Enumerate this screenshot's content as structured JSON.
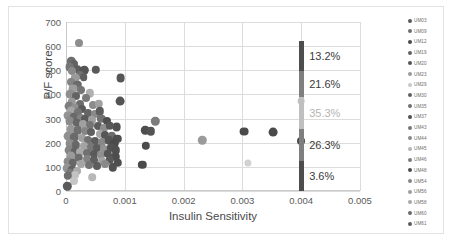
{
  "chart_data": {
    "type": "scatter",
    "title": "",
    "xlabel": "Insulin Sensitivity",
    "ylabel": "P/F score",
    "xlim": [
      0,
      0.005
    ],
    "ylim": [
      0,
      700
    ],
    "xticks": [
      "0",
      "0.001",
      "0.002",
      "0.003",
      "0.004",
      "0.005"
    ],
    "xtick_values": [
      0,
      0.001,
      0.002,
      0.003,
      0.004,
      0.005
    ],
    "yticks": [
      "0",
      "100",
      "200",
      "300",
      "400",
      "500",
      "600",
      "700"
    ],
    "ytick_values": [
      0,
      100,
      200,
      300,
      400,
      500,
      600,
      700
    ],
    "grid": true,
    "legend_position": "right",
    "legend": [
      {
        "label": "UM03",
        "color": "#595959"
      },
      {
        "label": "UM09",
        "color": "#6e6e6e"
      },
      {
        "label": "UM12",
        "color": "#4a4a4a"
      },
      {
        "label": "UM19",
        "color": "#636363"
      },
      {
        "label": "UM20",
        "color": "#555555"
      },
      {
        "label": "UM23",
        "color": "#9a9a9a"
      },
      {
        "label": "UM29",
        "color": "#c8c8c8"
      },
      {
        "label": "UM30",
        "color": "#5f5f5f"
      },
      {
        "label": "UM35",
        "color": "#707070"
      },
      {
        "label": "UM37",
        "color": "#4f4f4f"
      },
      {
        "label": "UM43",
        "color": "#777777"
      },
      {
        "label": "UM44",
        "color": "#8a8a8a"
      },
      {
        "label": "UM45",
        "color": "#b4b4b4"
      },
      {
        "label": "UM46",
        "color": "#7d7d7d"
      },
      {
        "label": "UM48",
        "color": "#4d4d4d"
      },
      {
        "label": "UM54",
        "color": "#868686"
      },
      {
        "label": "UM56",
        "color": "#9d9d9d"
      },
      {
        "label": "UM58",
        "color": "#a8a8a8"
      },
      {
        "label": "UM60",
        "color": "#6a6a6a"
      },
      {
        "label": "UM61",
        "color": "#5c5c5c"
      }
    ],
    "points": [
      {
        "x": 0.00022,
        "y": 612,
        "c": "#8d8d8d",
        "r": 4.0
      },
      {
        "x": 9e-05,
        "y": 537,
        "c": "#6e6e6e",
        "r": 4.2
      },
      {
        "x": 0.00014,
        "y": 528,
        "c": "#616161",
        "r": 4.0
      },
      {
        "x": 6e-05,
        "y": 512,
        "c": "#757575",
        "r": 4.4
      },
      {
        "x": 0.0002,
        "y": 505,
        "c": "#5e5e5e",
        "r": 3.8
      },
      {
        "x": 0.00011,
        "y": 496,
        "c": "#8a8a8a",
        "r": 4.0
      },
      {
        "x": 0.00031,
        "y": 500,
        "c": "#555555",
        "r": 4.2
      },
      {
        "x": 0.00051,
        "y": 503,
        "c": "#5a5a5a",
        "r": 4.2
      },
      {
        "x": 0.00024,
        "y": 479,
        "c": "#707070",
        "r": 4.0
      },
      {
        "x": 0.00016,
        "y": 470,
        "c": "#9a9a9a",
        "r": 4.2
      },
      {
        "x": 0.0003,
        "y": 472,
        "c": "#5f5f5f",
        "r": 3.8
      },
      {
        "x": 0.00093,
        "y": 468,
        "c": "#565656",
        "r": 4.4
      },
      {
        "x": 8e-05,
        "y": 452,
        "c": "#848484",
        "r": 4.0
      },
      {
        "x": 0.00019,
        "y": 440,
        "c": "#6b6b6b",
        "r": 4.2
      },
      {
        "x": 0.00012,
        "y": 424,
        "c": "#9c9c9c",
        "r": 4.4
      },
      {
        "x": 0.00026,
        "y": 418,
        "c": "#757575",
        "r": 4.0
      },
      {
        "x": 0.0004,
        "y": 404,
        "c": "#b0b0b0",
        "r": 4.2
      },
      {
        "x": 7e-05,
        "y": 400,
        "c": "#8f8f8f",
        "r": 4.4
      },
      {
        "x": 0.00017,
        "y": 392,
        "c": "#636363",
        "r": 4.0
      },
      {
        "x": 0.00034,
        "y": 386,
        "c": "#7a7a7a",
        "r": 4.0
      },
      {
        "x": 0.00092,
        "y": 374,
        "c": "#545454",
        "r": 4.4
      },
      {
        "x": 0.0001,
        "y": 368,
        "c": "#999999",
        "r": 4.2
      },
      {
        "x": 0.00023,
        "y": 360,
        "c": "#6d6d6d",
        "r": 4.0
      },
      {
        "x": 0.00046,
        "y": 357,
        "c": "#8c8c8c",
        "r": 4.0
      },
      {
        "x": 0.00056,
        "y": 360,
        "c": "#a2a2a2",
        "r": 4.2
      },
      {
        "x": 5e-05,
        "y": 352,
        "c": "#7e7e7e",
        "r": 4.4
      },
      {
        "x": 0.00015,
        "y": 344,
        "c": "#909090",
        "r": 4.2
      },
      {
        "x": 0.00028,
        "y": 338,
        "c": "#5b5b5b",
        "r": 4.0
      },
      {
        "x": 9e-05,
        "y": 330,
        "c": "#a5a5a5",
        "r": 4.4
      },
      {
        "x": 0.00021,
        "y": 326,
        "c": "#747474",
        "r": 4.0
      },
      {
        "x": 0.00037,
        "y": 322,
        "c": "#656565",
        "r": 4.0
      },
      {
        "x": 0.0005,
        "y": 318,
        "c": "#8a8a8a",
        "r": 4.0
      },
      {
        "x": 0.00058,
        "y": 330,
        "c": "#5d5d5d",
        "r": 4.2
      },
      {
        "x": 4e-05,
        "y": 312,
        "c": "#949494",
        "r": 4.4
      },
      {
        "x": 0.00013,
        "y": 308,
        "c": "#6a6a6a",
        "r": 4.2
      },
      {
        "x": 0.00025,
        "y": 302,
        "c": "#828282",
        "r": 4.0
      },
      {
        "x": 0.00033,
        "y": 298,
        "c": "#5a5a5a",
        "r": 4.0
      },
      {
        "x": 0.00044,
        "y": 294,
        "c": "#9e9e9e",
        "r": 4.0
      },
      {
        "x": 0.0006,
        "y": 300,
        "c": "#717171",
        "r": 4.2
      },
      {
        "x": 0.00069,
        "y": 292,
        "c": "#4f4f4f",
        "r": 4.0
      },
      {
        "x": 0.00086,
        "y": 266,
        "c": "#505050",
        "r": 4.4
      },
      {
        "x": 0.00152,
        "y": 288,
        "c": "#7c7c7c",
        "r": 4.2
      },
      {
        "x": 6e-05,
        "y": 288,
        "c": "#8b8b8b",
        "r": 4.4
      },
      {
        "x": 0.00018,
        "y": 282,
        "c": "#666666",
        "r": 4.2
      },
      {
        "x": 0.00029,
        "y": 278,
        "c": "#a0a0a0",
        "r": 4.0
      },
      {
        "x": 0.00041,
        "y": 272,
        "c": "#757575",
        "r": 4.0
      },
      {
        "x": 0.00054,
        "y": 268,
        "c": "#5c5c5c",
        "r": 4.0
      },
      {
        "x": 0.00064,
        "y": 262,
        "c": "#8e8e8e",
        "r": 4.0
      },
      {
        "x": 0.00075,
        "y": 270,
        "c": "#585858",
        "r": 4.2
      },
      {
        "x": 0.00135,
        "y": 252,
        "c": "#4d4d4d",
        "r": 4.2
      },
      {
        "x": 0.00144,
        "y": 248,
        "c": "#535353",
        "r": 4.2
      },
      {
        "x": 0.00232,
        "y": 210,
        "c": "#9b9b9b",
        "r": 4.2
      },
      {
        "x": 0.00303,
        "y": 246,
        "c": "#4a4a4a",
        "r": 4.4
      },
      {
        "x": 0.00352,
        "y": 244,
        "c": "#4a4a4a",
        "r": 4.4
      },
      {
        "x": 8e-05,
        "y": 258,
        "c": "#979797",
        "r": 4.4
      },
      {
        "x": 0.0002,
        "y": 252,
        "c": "#6f6f6f",
        "r": 4.2
      },
      {
        "x": 0.00032,
        "y": 248,
        "c": "#858585",
        "r": 4.0
      },
      {
        "x": 0.00043,
        "y": 244,
        "c": "#606060",
        "r": 4.0
      },
      {
        "x": 0.00057,
        "y": 238,
        "c": "#a6a6a6",
        "r": 4.0
      },
      {
        "x": 0.00066,
        "y": 232,
        "c": "#565656",
        "r": 4.0
      },
      {
        "x": 0.00078,
        "y": 228,
        "c": "#6c6c6c",
        "r": 4.2
      },
      {
        "x": 0.00087,
        "y": 216,
        "c": "#4e4e4e",
        "r": 4.2
      },
      {
        "x": 0.00136,
        "y": 188,
        "c": "#4c4c4c",
        "r": 4.2
      },
      {
        "x": 3e-05,
        "y": 228,
        "c": "#909090",
        "r": 4.4
      },
      {
        "x": 0.00014,
        "y": 222,
        "c": "#6a6a6a",
        "r": 4.2
      },
      {
        "x": 0.00027,
        "y": 218,
        "c": "#9f9f9f",
        "r": 4.0
      },
      {
        "x": 0.00038,
        "y": 212,
        "c": "#727272",
        "r": 4.0
      },
      {
        "x": 0.00049,
        "y": 208,
        "c": "#5e5e5e",
        "r": 4.0
      },
      {
        "x": 0.00062,
        "y": 204,
        "c": "#888888",
        "r": 4.0
      },
      {
        "x": 0.00073,
        "y": 210,
        "c": "#555555",
        "r": 4.2
      },
      {
        "x": 0.00082,
        "y": 198,
        "c": "#4b4b4b",
        "r": 4.2
      },
      {
        "x": 0.004,
        "y": 206,
        "c": "#4a4a4a",
        "r": 4.0
      },
      {
        "x": 7e-05,
        "y": 196,
        "c": "#8d8d8d",
        "r": 4.4
      },
      {
        "x": 0.00017,
        "y": 190,
        "c": "#686868",
        "r": 4.2
      },
      {
        "x": 0.0003,
        "y": 186,
        "c": "#a3a3a3",
        "r": 4.0
      },
      {
        "x": 0.00042,
        "y": 182,
        "c": "#777777",
        "r": 4.0
      },
      {
        "x": 0.00053,
        "y": 178,
        "c": "#5d5d5d",
        "r": 4.0
      },
      {
        "x": 0.00065,
        "y": 174,
        "c": "#929292",
        "r": 4.0
      },
      {
        "x": 0.00077,
        "y": 180,
        "c": "#525252",
        "r": 4.2
      },
      {
        "x": 0.00085,
        "y": 168,
        "c": "#4f4f4f",
        "r": 4.2
      },
      {
        "x": 5e-05,
        "y": 170,
        "c": "#868686",
        "r": 4.4
      },
      {
        "x": 0.00016,
        "y": 164,
        "c": "#646464",
        "r": 4.2
      },
      {
        "x": 0.00024,
        "y": 160,
        "c": "#a8a8a8",
        "r": 4.0
      },
      {
        "x": 0.00036,
        "y": 156,
        "c": "#707070",
        "r": 4.0
      },
      {
        "x": 0.00047,
        "y": 152,
        "c": "#5a5a5a",
        "r": 4.0
      },
      {
        "x": 0.00059,
        "y": 148,
        "c": "#8f8f8f",
        "r": 4.0
      },
      {
        "x": 0.00071,
        "y": 154,
        "c": "#565656",
        "r": 4.2
      },
      {
        "x": 0.00084,
        "y": 142,
        "c": "#4d4d4d",
        "r": 4.2
      },
      {
        "x": 0.0013,
        "y": 108,
        "c": "#4b4b4b",
        "r": 4.2
      },
      {
        "x": 9e-05,
        "y": 144,
        "c": "#9a9a9a",
        "r": 4.4
      },
      {
        "x": 0.00022,
        "y": 138,
        "c": "#6d6d6d",
        "r": 4.2
      },
      {
        "x": 0.00035,
        "y": 134,
        "c": "#838383",
        "r": 4.0
      },
      {
        "x": 0.00048,
        "y": 128,
        "c": "#5f5f5f",
        "r": 4.0
      },
      {
        "x": 0.00061,
        "y": 124,
        "c": "#a1a1a1",
        "r": 4.0
      },
      {
        "x": 0.00074,
        "y": 130,
        "c": "#595959",
        "r": 4.2
      },
      {
        "x": 0.00088,
        "y": 118,
        "c": "#4e4e4e",
        "r": 4.2
      },
      {
        "x": 4e-05,
        "y": 122,
        "c": "#8c8c8c",
        "r": 4.4
      },
      {
        "x": 0.00012,
        "y": 116,
        "c": "#676767",
        "r": 4.2
      },
      {
        "x": 0.00026,
        "y": 112,
        "c": "#a4a4a4",
        "r": 4.0
      },
      {
        "x": 0.00039,
        "y": 108,
        "c": "#747474",
        "r": 4.0
      },
      {
        "x": 0.00052,
        "y": 102,
        "c": "#5c5c5c",
        "r": 4.0
      },
      {
        "x": 0.00067,
        "y": 110,
        "c": "#898989",
        "r": 4.0
      },
      {
        "x": 0.0008,
        "y": 98,
        "c": "#515151",
        "r": 4.2
      },
      {
        "x": 2e-05,
        "y": 96,
        "c": "#949494",
        "r": 4.4
      },
      {
        "x": 0.00011,
        "y": 88,
        "c": "#626262",
        "r": 4.2
      },
      {
        "x": 0.00019,
        "y": 82,
        "c": "#ababab",
        "r": 4.0
      },
      {
        "x": 6e-05,
        "y": 74,
        "c": "#7b7b7b",
        "r": 4.2
      },
      {
        "x": 0.00015,
        "y": 68,
        "c": "#c2c2c2",
        "r": 4.0
      },
      {
        "x": 3e-05,
        "y": 62,
        "c": "#6e6e6e",
        "r": 4.2
      },
      {
        "x": 0.00013,
        "y": 40,
        "c": "#c6c6c6",
        "r": 4.0
      },
      {
        "x": 2e-05,
        "y": 20,
        "c": "#5b5b5b",
        "r": 4.2
      },
      {
        "x": 0.0031,
        "y": 116,
        "c": "#d2d2d2",
        "r": 3.6
      },
      {
        "x": 0.00045,
        "y": 56,
        "c": "#b8b8b8",
        "r": 3.8
      },
      {
        "x": 0.004,
        "y": 372,
        "c": "#c4c4c4",
        "r": 3.4
      }
    ],
    "percent_bar": {
      "x": 0.004,
      "segments": [
        {
          "from": 498,
          "to": 620,
          "color": "#4d4d4d",
          "label": "13.2%",
          "label_color": "#3a3a3a"
        },
        {
          "from": 390,
          "to": 498,
          "color": "#7f7f7f",
          "label": "21.6%",
          "label_color": "#3a3a3a"
        },
        {
          "from": 258,
          "to": 390,
          "color": "#bfbfbf",
          "label": "35.3%",
          "label_color": "#b5b5b5"
        },
        {
          "from": 126,
          "to": 258,
          "color": "#7f7f7f",
          "label": "26.3%",
          "label_color": "#3a3a3a"
        },
        {
          "from": 0,
          "to": 126,
          "color": "#4d4d4d",
          "label": "3.6%",
          "label_color": "#3a3a3a"
        }
      ]
    }
  }
}
